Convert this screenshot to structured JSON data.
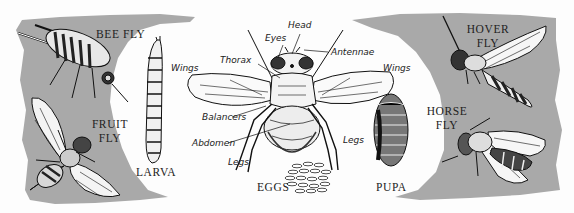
{
  "figure": {
    "colors": {
      "panel_gray": "#a9a9a9",
      "ink": "#1a1a1a",
      "paper": "#fdfdfd"
    }
  },
  "species": [
    {
      "id": "bee-fly",
      "label": "BEE FLY"
    },
    {
      "id": "fruit-fly",
      "label_line1": "FRUIT",
      "label_line2": "FLY"
    },
    {
      "id": "hover-fly",
      "label_line1": "HOVER",
      "label_line2": "FLY"
    },
    {
      "id": "horse-fly",
      "label_line1": "HORSE",
      "label_line2": "FLY"
    }
  ],
  "life_cycle": {
    "larva": "LARVA",
    "eggs": "EGGS",
    "pupa": "PUPA"
  },
  "anatomy": {
    "head": "Head",
    "eyes": "Eyes",
    "antennae": "Antennae",
    "thorax": "Thorax",
    "wings_left": "Wings",
    "wings_right": "Wings",
    "balancers": "Balancers",
    "abdomen": "Abdomen",
    "legs_left": "Legs",
    "legs_right": "Legs"
  }
}
